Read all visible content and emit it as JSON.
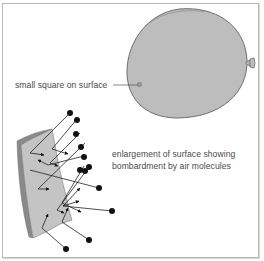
{
  "figure": {
    "labels": {
      "small_square": "small square on surface",
      "enlargement_line1": "enlargement of surface showing",
      "enlargement_line2": "bombardment by air molecules"
    },
    "colors": {
      "balloon_fill": "#bdbdbd",
      "balloon_outline": "#6e6e6e",
      "surface_fill": "#c4c4c4",
      "surface_edge": "#8a8a8a",
      "molecule": "#111111",
      "text": "#4a4a4a",
      "frame": "#b8b8b8"
    },
    "elements": {
      "balloon": "inflated balloon with knot at right",
      "small_square": "small square marked on balloon surface",
      "surface_piece": "enlarged curved piece of balloon surface",
      "molecules": "air molecules (black dots) with paths bouncing off surface",
      "molecule_count": 12
    }
  }
}
